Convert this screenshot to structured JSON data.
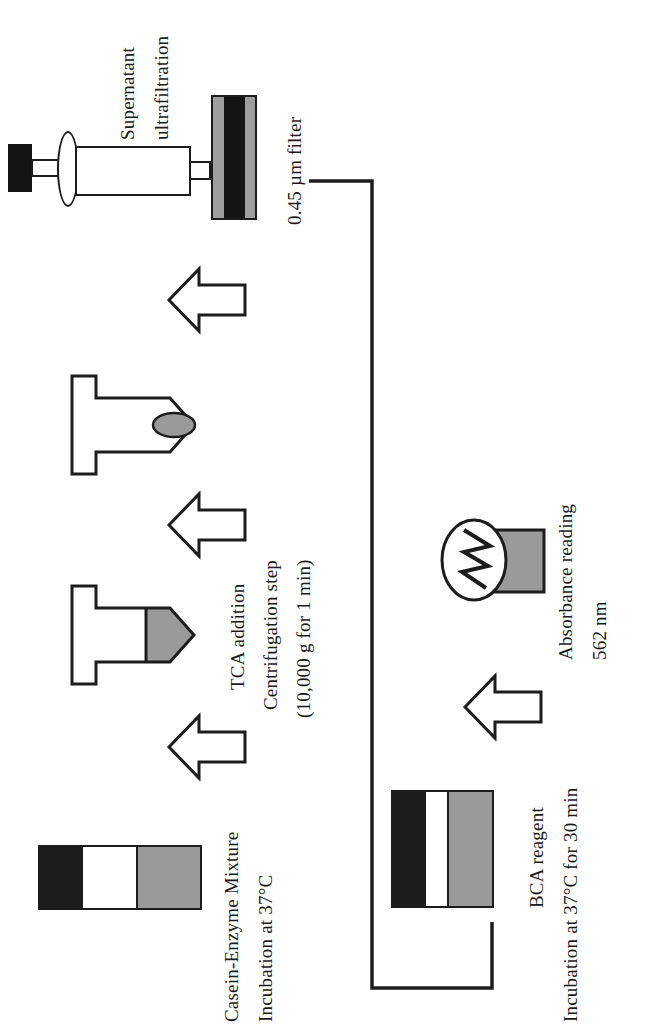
{
  "figure": {
    "orientation": "rotated-90-ccw",
    "background_color": "#ffffff",
    "line_color": "#1c1c1c",
    "gray_fill": "#9a9a9a",
    "dark_fill": "#1c1c1c",
    "white_fill": "#ffffff"
  },
  "steps": [
    {
      "id": "step-casein-enzyme",
      "labels": [
        "Casein-Enzyme Mixture",
        "Incubation at 37°C"
      ],
      "icon": "three-band-cuvette",
      "bands": [
        "dark",
        "light",
        "gray"
      ]
    },
    {
      "id": "step-tca-centrifugation",
      "labels": [
        "TCA addition",
        "Centrifugation step",
        "(10,000 g for 1 min)"
      ],
      "icon": "microcentrifuge-tube-filled",
      "fill": "gray"
    },
    {
      "id": "step-pellet-tube",
      "labels": [],
      "icon": "microcentrifuge-tube-pellet",
      "fill": "white",
      "pellet": "gray"
    },
    {
      "id": "step-ultrafiltration",
      "labels": [
        "Supernatant",
        "ultrafiltration",
        "0.45 µm filter"
      ],
      "icon": "syringe-with-filter",
      "filter_layers": [
        "gray",
        "dark",
        "gray"
      ]
    },
    {
      "id": "step-bca-reagent",
      "labels": [
        "BCA reagent",
        "Incubation at 37°C for 30 min"
      ],
      "icon": "three-band-cuvette",
      "bands": [
        "dark",
        "light",
        "gray"
      ]
    },
    {
      "id": "step-absorbance",
      "labels": [
        "Absorbance reading",
        "562 nm"
      ],
      "icon": "spectrophotometer-cuvette",
      "wavelength": "562 nm"
    }
  ],
  "labels": {
    "supernatant": "Supernatant",
    "ultrafiltration": "ultrafiltration",
    "filter_spec": "0.45 µm filter",
    "tca_addition": "TCA addition",
    "centrifugation_step": "Centrifugation step",
    "centrifugation_params": "(10,000 g for 1 min)",
    "casein_enzyme": "Casein-Enzyme Mixture",
    "incubation_37": "Incubation at 37°C",
    "bca_reagent": "BCA reagent",
    "incubation_37_30min": "Incubation at 37°C for 30 min",
    "absorbance_reading": "Absorbance reading",
    "wavelength": "562 nm"
  },
  "icons": {
    "arrow": "block-arrow-icon",
    "syringe": "syringe-icon",
    "filter": "membrane-filter-icon",
    "tube": "microcentrifuge-tube-icon",
    "cuvette": "cuvette-icon",
    "spectrophotometer": "spectrophotometer-lamp-icon",
    "pellet": "pellet-icon",
    "connector": "flow-connector-icon"
  }
}
